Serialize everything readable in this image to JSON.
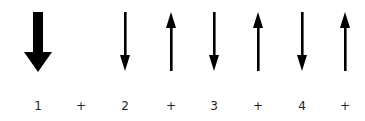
{
  "diagram": {
    "title": "",
    "strokes": [
      {
        "direction": "down",
        "emphasis": "accent",
        "x": 38
      },
      {
        "direction": "down",
        "emphasis": "normal",
        "x": 125
      },
      {
        "direction": "up",
        "emphasis": "normal",
        "x": 171
      },
      {
        "direction": "down",
        "emphasis": "normal",
        "x": 214
      },
      {
        "direction": "up",
        "emphasis": "normal",
        "x": 258
      },
      {
        "direction": "down",
        "emphasis": "normal",
        "x": 302
      },
      {
        "direction": "up",
        "emphasis": "normal",
        "x": 345
      }
    ],
    "counts": [
      {
        "label": "1",
        "x": 38
      },
      {
        "label": "+",
        "x": 81
      },
      {
        "label": "2",
        "x": 125
      },
      {
        "label": "+",
        "x": 171
      },
      {
        "label": "3",
        "x": 214
      },
      {
        "label": "+",
        "x": 258
      },
      {
        "label": "4",
        "x": 302
      },
      {
        "label": "+",
        "x": 345
      }
    ],
    "colors": {
      "arrow": "#000000",
      "text": "#222222",
      "background": "#ffffff"
    }
  }
}
